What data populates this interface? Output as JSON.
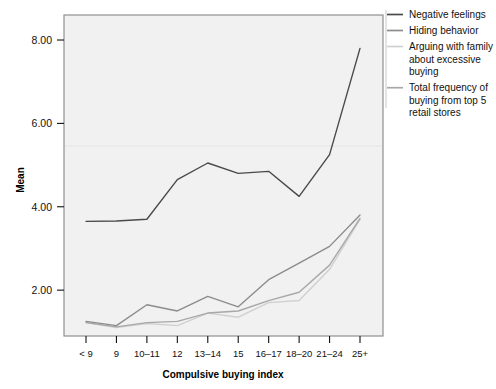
{
  "chart_data": {
    "type": "line",
    "title": "",
    "xlabel": "Compulsive buying index",
    "ylabel": "Mean",
    "categories": [
      "< 9",
      "9",
      "10–11",
      "12",
      "13–14",
      "15",
      "16–17",
      "18–20",
      "21–24",
      "25+"
    ],
    "ylim": [
      0.9,
      8.6
    ],
    "yticks": [
      2.0,
      4.0,
      6.0,
      8.0
    ],
    "ytick_labels": [
      "2.00",
      "4.00",
      "6.00",
      "8.00"
    ],
    "grid": false,
    "legend_position": "right",
    "series": [
      {
        "name": "Negative feelings",
        "color": "#4a4a4a",
        "values": [
          3.65,
          3.66,
          3.7,
          4.65,
          5.05,
          4.8,
          4.85,
          4.25,
          5.25,
          7.8
        ]
      },
      {
        "name": "Hiding behavior",
        "color": "#8c8c8c",
        "values": [
          1.25,
          1.15,
          1.65,
          1.5,
          1.85,
          1.6,
          2.25,
          2.65,
          3.05,
          3.8
        ]
      },
      {
        "name": "Arguing with family about excessive buying",
        "color": "#d0d0d0",
        "values": [
          1.22,
          1.1,
          1.2,
          1.15,
          1.45,
          1.35,
          1.7,
          1.75,
          2.5,
          3.7
        ]
      },
      {
        "name": "Total frequency of buying from top 5 retail stores",
        "color": "#a8a8a8",
        "values": [
          1.22,
          1.12,
          1.22,
          1.25,
          1.45,
          1.5,
          1.75,
          1.95,
          2.6,
          3.72
        ]
      }
    ]
  },
  "legend": {
    "entries": [
      {
        "label": "Negative feelings",
        "lines": [
          "Negative feelings"
        ]
      },
      {
        "label": "Hiding behavior",
        "lines": [
          "Hiding behavior"
        ]
      },
      {
        "label": "Arguing with family about excessive buying",
        "lines": [
          "Arguing with family",
          "about excessive",
          "buying"
        ]
      },
      {
        "label": "Total frequency of buying from top 5 retail stores",
        "lines": [
          "Total frequency of",
          "buying from top 5",
          "retail stores"
        ]
      }
    ]
  },
  "plot": {
    "background": "#f1f1f1",
    "border_color": "#808080"
  }
}
